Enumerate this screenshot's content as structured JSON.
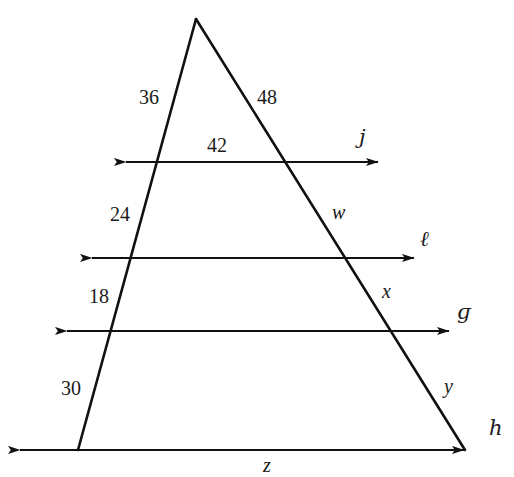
{
  "figure": {
    "background_color": "#ffffff",
    "stroke_color": "#111111",
    "text_color": "#1a1a1a",
    "width": 514,
    "height": 477
  },
  "segment_labels": {
    "left_top": "36",
    "right_top": "48",
    "top_parallel_span": "42",
    "left_second": "24",
    "right_second": "w",
    "left_third": "18",
    "right_third": "x",
    "left_fourth": "30",
    "right_fourth": "y",
    "bottom_span": "z"
  },
  "line_labels": {
    "line_1": "ј",
    "line_2": "ℓ",
    "line_3": "ɡ",
    "line_4": "һ"
  },
  "label_positions": {
    "left_top": {
      "x": 139,
      "y": 87
    },
    "right_top": {
      "x": 257,
      "y": 87
    },
    "top_parallel_span": {
      "x": 207,
      "y": 135
    },
    "left_second": {
      "x": 110,
      "y": 204
    },
    "right_second": {
      "x": 332,
      "y": 202
    },
    "left_third": {
      "x": 89,
      "y": 286
    },
    "right_third": {
      "x": 382,
      "y": 281
    },
    "left_fourth": {
      "x": 61,
      "y": 378
    },
    "right_fourth": {
      "x": 444,
      "y": 376
    },
    "bottom_span": {
      "x": 263,
      "y": 455
    },
    "line_1": {
      "x": 359,
      "y": 127
    },
    "line_2": {
      "x": 420,
      "y": 229
    },
    "line_3": {
      "x": 457,
      "y": 302
    },
    "line_4": {
      "x": 489,
      "y": 418
    }
  },
  "geometry": {
    "apex": {
      "x": 196,
      "y": 19
    },
    "left_base": {
      "x": 78,
      "y": 450
    },
    "right_base": {
      "x": 465,
      "y": 450
    },
    "parallel_lines": [
      {
        "name": "line_1",
        "y": 162,
        "x_start": 114,
        "x_end": 390
      },
      {
        "name": "line_2",
        "y": 258,
        "x_start": 80,
        "x_end": 426
      },
      {
        "name": "line_3",
        "y": 331,
        "x_start": 55,
        "x_end": 461
      },
      {
        "name": "line_4",
        "y": 450,
        "x_start": 8,
        "x_end": 476
      }
    ]
  }
}
